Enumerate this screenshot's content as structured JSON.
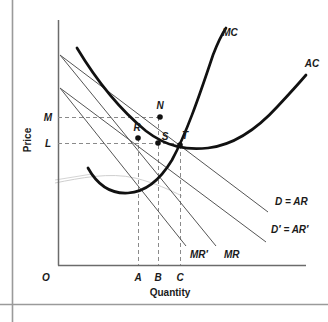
{
  "figure": {
    "type": "economics-diagram",
    "title": "",
    "axes": {
      "y_label": "Price",
      "x_label": "Quantity",
      "origin_label": "O",
      "y_ticks": [
        {
          "id": "M",
          "label": "M",
          "y": 117
        },
        {
          "id": "L",
          "label": "L",
          "y": 143
        }
      ],
      "x_ticks": [
        {
          "id": "A",
          "label": "A",
          "x": 138
        },
        {
          "id": "B",
          "label": "B",
          "x": 158
        },
        {
          "id": "C",
          "label": "C",
          "x": 180
        }
      ]
    },
    "curves": [
      {
        "id": "MC",
        "label": "MC",
        "kind": "marginal-cost",
        "stroke": "#111111",
        "width": 2.6
      },
      {
        "id": "AC",
        "label": "AC",
        "kind": "average-cost",
        "stroke": "#111111",
        "width": 2.6
      },
      {
        "id": "D_AR",
        "label": "D = AR",
        "kind": "demand",
        "stroke": "#555555",
        "width": 1
      },
      {
        "id": "Dp_ARp",
        "label": "D′ = AR′",
        "kind": "demand-shifted",
        "stroke": "#555555",
        "width": 1
      },
      {
        "id": "MR",
        "label": "MR",
        "kind": "marginal-revenue",
        "stroke": "#555555",
        "width": 1
      },
      {
        "id": "MRp",
        "label": "MR′",
        "kind": "marginal-revenue-shifted",
        "stroke": "#555555",
        "width": 1
      }
    ],
    "points": [
      {
        "id": "N",
        "label": "N",
        "x": 160,
        "y": 117
      },
      {
        "id": "R",
        "label": "R",
        "x": 138,
        "y": 138
      },
      {
        "id": "S",
        "label": "S",
        "x": 158,
        "y": 143
      },
      {
        "id": "T",
        "label": "T",
        "x": 180,
        "y": 145
      }
    ],
    "colors": {
      "curve_dark": "#111111",
      "curve_light": "#555555",
      "axis": "#6b6b6b",
      "dashed": "#8a8a8a",
      "border_rule": "#9a9a9a",
      "background": "#ffffff"
    }
  }
}
